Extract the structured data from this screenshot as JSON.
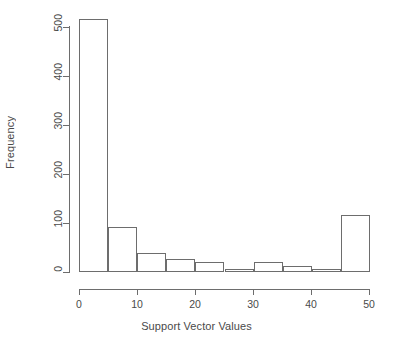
{
  "chart_data": {
    "type": "bar",
    "subtype": "histogram",
    "title": "",
    "xlabel": "Support Vector Values",
    "ylabel": "Frequency",
    "bin_width": 5,
    "bin_edges": [
      0,
      5,
      10,
      15,
      20,
      25,
      30,
      35,
      40,
      45,
      50
    ],
    "categories": [
      "0-5",
      "5-10",
      "10-15",
      "15-20",
      "20-25",
      "25-30",
      "30-35",
      "35-40",
      "40-45",
      "45-50"
    ],
    "values": [
      518,
      92,
      39,
      27,
      22,
      8,
      22,
      13,
      7,
      117
    ],
    "xlim": [
      0,
      50
    ],
    "ylim": [
      0,
      520
    ],
    "xticks": [
      0,
      10,
      20,
      30,
      40,
      50
    ],
    "yticks": [
      0,
      100,
      200,
      300,
      400,
      500
    ],
    "xtick_labels": [
      "0",
      "10",
      "20",
      "30",
      "40",
      "50"
    ],
    "ytick_labels": [
      "0",
      "100",
      "200",
      "300",
      "400",
      "500"
    ],
    "grid": false,
    "legend": false,
    "bar_fill": "#ffffff",
    "bar_stroke": "#6d6d6d",
    "axis_color": "#6d6d6d",
    "text_color": "#4a4a4a",
    "background": "#ffffff"
  }
}
